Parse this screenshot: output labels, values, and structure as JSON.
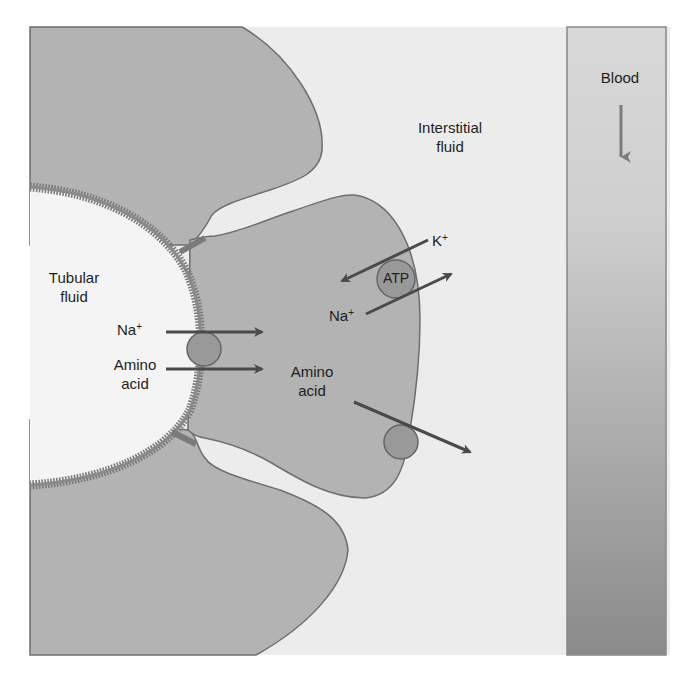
{
  "diagram": {
    "title_regions": {
      "tubular_fluid": [
        "Tubular",
        "fluid"
      ],
      "interstitial_fluid": [
        "Interstitial",
        "fluid"
      ],
      "blood": "Blood"
    },
    "apical_transport": {
      "na": {
        "symbol": "Na",
        "charge": "+"
      },
      "amino_acid_lumen": [
        "Amino",
        "acid"
      ]
    },
    "cell_interior": {
      "amino_acid_cell": [
        "Amino",
        "acid"
      ]
    },
    "basolateral_pump": {
      "label": "ATP",
      "k": {
        "symbol": "K",
        "charge": "+"
      },
      "na": {
        "symbol": "Na",
        "charge": "+"
      }
    },
    "colors": {
      "cell": "#b3b3b3",
      "cell_outline": "#6e6e6e",
      "lumen": "#f4f4f4",
      "interstitial": "#ececec",
      "brush_border": "#7a7a7a",
      "transporter": "#999999",
      "arrow": "#4a4a4a",
      "blood_top": "#d6d6d6",
      "blood_bottom": "#8c8c8c",
      "blood_arrow": "#7c7c7c"
    }
  }
}
